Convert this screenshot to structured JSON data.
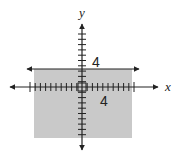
{
  "diagram": {
    "type": "coordinate-plane-inequality",
    "axes": {
      "x_label": "x",
      "y_label": "y",
      "tick_spacing_units": 1,
      "x_tick_range": [
        -10,
        10
      ],
      "y_tick_range": [
        -10,
        10
      ]
    },
    "boundary_line": {
      "equation": "y = 4",
      "style": "solid",
      "label": "4"
    },
    "x_axis_label_value": "4",
    "shaded_region": {
      "description": "below boundary line",
      "color": "#c9c9c9"
    },
    "colors": {
      "line": "#222222",
      "shade": "#c9c9c9",
      "background": "#ffffff"
    }
  }
}
